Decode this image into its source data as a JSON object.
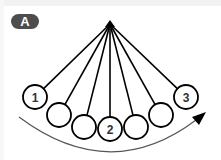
{
  "panel": {
    "label": "A",
    "badge_color": "#4d4d4d"
  },
  "diagram": {
    "pivot": {
      "x": 110,
      "y": 24
    },
    "balls": [
      {
        "x": 35,
        "y": 97,
        "label": "1"
      },
      {
        "x": 59,
        "y": 115,
        "label": ""
      },
      {
        "x": 84,
        "y": 127,
        "label": ""
      },
      {
        "x": 110,
        "y": 129,
        "label": "2"
      },
      {
        "x": 136,
        "y": 127,
        "label": ""
      },
      {
        "x": 161,
        "y": 115,
        "label": ""
      },
      {
        "x": 186,
        "y": 97,
        "label": "3"
      }
    ],
    "ball_radius": 12,
    "stroke_color": "#000000",
    "arc_color": "#555555",
    "arrow": {
      "direction": "left-to-right",
      "description": "swing direction arrow"
    }
  }
}
